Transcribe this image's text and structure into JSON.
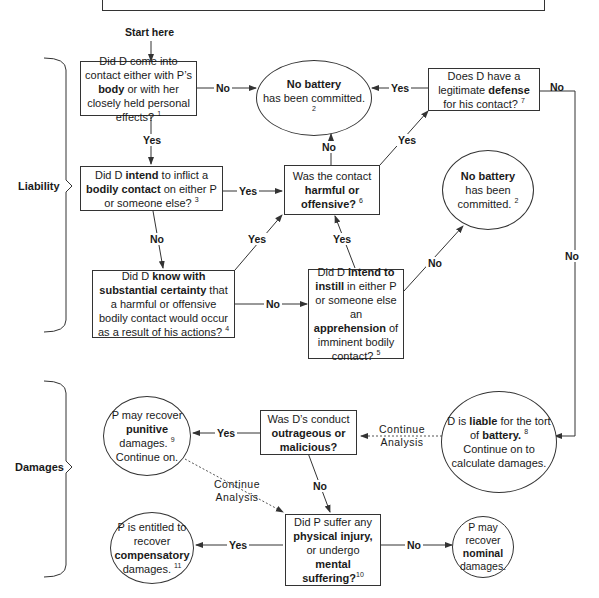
{
  "start_label": "Start here",
  "sections": {
    "liability": "Liability",
    "damages": "Damages"
  },
  "nodes": {
    "contact": {
      "pre": "Did D come into contact either with P’s ",
      "bold": "body",
      "post": " or with her closely held personal effects?",
      "note": "1"
    },
    "no_battery_1": {
      "bold": "No battery",
      "post": " has been committed.",
      "note": "2"
    },
    "defense": {
      "pre": "Does D have a legitimate ",
      "bold": "defense",
      "post": " for his contact?",
      "note": "7"
    },
    "intend_contact": {
      "pre": "Did D ",
      "bold": "intend",
      "mid": " to inflict a ",
      "bold2": "bodily contact",
      "post": " on either P or someone else?",
      "note": "3"
    },
    "harmful": {
      "pre": "Was the contact ",
      "bold": "harmful or offensive?",
      "note": "6"
    },
    "no_battery_2": {
      "bold": "No battery",
      "post": " has been committed.",
      "note": "2"
    },
    "knowledge": {
      "pre": "Did D ",
      "bold": "know with substantial certainty",
      "post": " that a harmful or offensive bodily contact would occur as a result of his actions?",
      "note": "4"
    },
    "apprehension": {
      "pre": "Did D ",
      "bold": "intend to instill",
      "mid": " in either P or someone else an ",
      "bold2": "apprehension",
      "post": " of imminent bodily contact?",
      "note": "5"
    },
    "punitive": {
      "pre": "P may recover ",
      "bold": "punitive",
      "post": " damages.",
      "note": "9",
      "tail": "Continue on."
    },
    "outrageous": {
      "pre": "Was D’s conduct ",
      "bold": "outrageous or malicious?"
    },
    "liable": {
      "pre": "D is ",
      "bold": "liable",
      "mid": " for the tort of ",
      "bold2": "battery.",
      "note": "8",
      "tail": "Continue on to calculate damages."
    },
    "compensatory": {
      "pre": "P is entitled to recover ",
      "bold": "compensatory",
      "post": " damages.",
      "note": "11"
    },
    "injury": {
      "pre": "Did P suffer any ",
      "bold": "physical injury,",
      "mid": " or undergo ",
      "bold2": "mental suffering?",
      "note": "10"
    },
    "nominal": {
      "pre": "P may recover ",
      "bold": "nominal",
      "post": " damages."
    }
  },
  "edges": {
    "yes": "Yes",
    "no": "No",
    "continue_1": "Continue Analysis",
    "continue_2": "Continue Analysis"
  },
  "colors": {
    "line": "#333333",
    "background": "#ffffff",
    "text": "#1a1a1a"
  }
}
